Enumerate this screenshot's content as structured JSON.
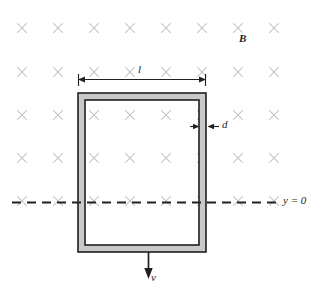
{
  "figure": {
    "width": 327,
    "height": 295,
    "background": "#ffffff"
  },
  "labels": {
    "magnetic_field": "B",
    "loop_width": "l",
    "loop_thickness": "d",
    "axis_reference": "y = 0",
    "velocity": "v"
  },
  "colors": {
    "ink": "#231f20",
    "field_mark": "#b9b9b9",
    "loop_band": "#c9c9c9",
    "background": "#ffffff"
  },
  "field": {
    "symbol": "x",
    "meaning": "magnetic-field-into-page",
    "columns": 8,
    "rows": 5,
    "x_positions": [
      22,
      58,
      94,
      130,
      166,
      202,
      238,
      274
    ],
    "y_positions": [
      28,
      72,
      115,
      158,
      202
    ],
    "mark_size": 9
  },
  "loop": {
    "outer": {
      "x": 78,
      "y": 93,
      "width": 128,
      "height": 159
    },
    "band_thickness": 7,
    "fill": "#c9c9c9",
    "stroke": "#231f20"
  },
  "dimension_l": {
    "y": 79,
    "x_start": 78,
    "x_end": 206,
    "label": "l"
  },
  "dimension_d": {
    "y": 126,
    "x_start": 193,
    "x_end": 213,
    "label": "d"
  },
  "axis": {
    "label": "y = 0",
    "y": 202,
    "x_start": 12,
    "x_end": 281,
    "style": "dashed"
  },
  "velocity_arrow": {
    "label": "v",
    "x": 148,
    "y_start": 252,
    "y_end": 278,
    "direction": "down"
  }
}
